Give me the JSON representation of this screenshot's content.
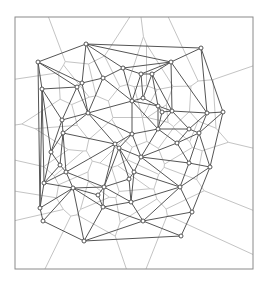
{
  "diagram": {
    "type": "delaunay-voronoi",
    "colors": {
      "background": "#ffffff",
      "frame": "#8a8a8a",
      "delaunay_edge": "#555555",
      "voronoi_edge": "#c4c4c4",
      "site_fill": "#ffffff",
      "site_stroke": "#444444"
    },
    "frame": {
      "x": 15,
      "y": 17,
      "width": 238,
      "height": 252
    },
    "sites": [
      [
        38,
        62
      ],
      [
        86,
        44
      ],
      [
        201,
        48
      ],
      [
        171,
        62
      ],
      [
        123,
        68
      ],
      [
        103,
        78
      ],
      [
        141,
        74
      ],
      [
        152,
        74
      ],
      [
        42,
        89
      ],
      [
        77,
        87
      ],
      [
        82,
        83
      ],
      [
        62,
        120
      ],
      [
        88,
        113
      ],
      [
        63,
        133
      ],
      [
        132,
        101
      ],
      [
        143,
        98
      ],
      [
        158,
        106
      ],
      [
        162,
        112
      ],
      [
        172,
        111
      ],
      [
        207,
        113
      ],
      [
        223,
        112
      ],
      [
        158,
        129
      ],
      [
        189,
        129
      ],
      [
        199,
        133
      ],
      [
        177,
        143
      ],
      [
        132,
        134
      ],
      [
        115,
        144
      ],
      [
        119,
        148
      ],
      [
        141,
        157
      ],
      [
        189,
        163
      ],
      [
        210,
        167
      ],
      [
        51,
        152
      ],
      [
        60,
        165
      ],
      [
        66,
        172
      ],
      [
        44,
        183
      ],
      [
        73,
        188
      ],
      [
        40,
        208
      ],
      [
        43,
        221
      ],
      [
        134,
        172
      ],
      [
        129,
        179
      ],
      [
        104,
        187
      ],
      [
        98,
        195
      ],
      [
        103,
        207
      ],
      [
        131,
        202
      ],
      [
        143,
        221
      ],
      [
        180,
        187
      ],
      [
        192,
        212
      ],
      [
        181,
        236
      ],
      [
        84,
        241
      ]
    ],
    "voronoi_boundary_hits": {
      "top": [
        50,
        130,
        141,
        170
      ],
      "bottom": [
        46,
        125,
        148
      ]
    }
  }
}
